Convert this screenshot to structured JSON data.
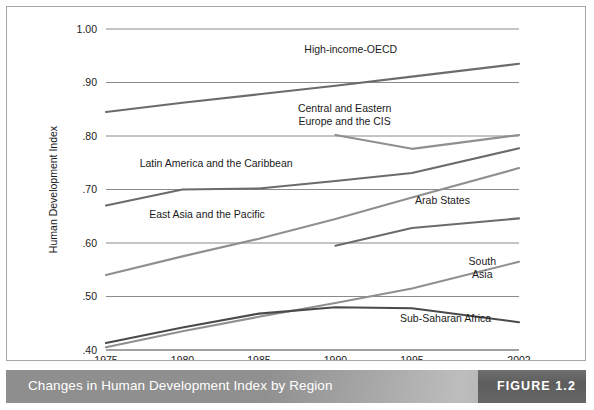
{
  "caption": {
    "title": "Changes in Human Development Index by Region",
    "figure_number": "FIGURE 1.2"
  },
  "chart_data": {
    "type": "line",
    "title": "Changes in Human Development Index by Region",
    "xlabel": "",
    "ylabel": "Human Development Index",
    "x": [
      1975,
      1980,
      1985,
      1990,
      1995,
      2002
    ],
    "xtick_labels": [
      "1975",
      "1980",
      "1985",
      "1990",
      "1995",
      "2002"
    ],
    "xlim": [
      1975,
      2002
    ],
    "ylim": [
      0.4,
      1.0
    ],
    "yticks": [
      0.4,
      0.5,
      0.6,
      0.7,
      0.8,
      0.9,
      1.0
    ],
    "ytick_labels": [
      ".40",
      ".50",
      ".60",
      ".70",
      ".80",
      ".90",
      "1.00"
    ],
    "grid": "horizontal",
    "legend_position": "inline-annotations",
    "series": [
      {
        "name": "High-income-OECD",
        "color": "#6b6b6b",
        "label_x": 1991.0,
        "label_y": 0.955,
        "label_anchor": "middle",
        "x": [
          1975,
          1980,
          1985,
          1990,
          1995,
          2002
        ],
        "values": [
          0.845,
          0.862,
          0.878,
          0.894,
          0.911,
          0.935
        ]
      },
      {
        "name": "Central and Eastern Europe and the CIS",
        "color": "#8f8f8f",
        "label_lines": [
          "Central and Eastern",
          "Europe and the CIS"
        ],
        "label_x": 1990.6,
        "label_y": 0.845,
        "label_anchor": "middle",
        "x": [
          1990,
          1995,
          2002
        ],
        "values": [
          0.802,
          0.776,
          0.802
        ]
      },
      {
        "name": "Latin America and the Caribbean",
        "color": "#6b6b6b",
        "label_x": 1982.2,
        "label_y": 0.742,
        "label_anchor": "middle",
        "x": [
          1975,
          1980,
          1985,
          1990,
          1995,
          2002
        ],
        "values": [
          0.67,
          0.7,
          0.702,
          0.716,
          0.731,
          0.777
        ]
      },
      {
        "name": "East Asia and the Pacific",
        "color": "#8f8f8f",
        "label_x": 1981.6,
        "label_y": 0.646,
        "label_anchor": "middle",
        "x": [
          1975,
          1980,
          1985,
          1990,
          1995,
          2002
        ],
        "values": [
          0.54,
          0.575,
          0.608,
          0.645,
          0.685,
          0.74
        ]
      },
      {
        "name": "Arab States",
        "color": "#6b6b6b",
        "label_x": 1997.0,
        "label_y": 0.672,
        "label_anchor": "middle",
        "x": [
          1990,
          1995,
          2002
        ],
        "values": [
          0.595,
          0.628,
          0.646
        ]
      },
      {
        "name": "South Asia",
        "color": "#8f8f8f",
        "label_lines": [
          "South",
          "Asia"
        ],
        "label_x": 1999.6,
        "label_y": 0.558,
        "label_anchor": "middle",
        "x": [
          1975,
          1980,
          1985,
          1990,
          1995,
          2002
        ],
        "values": [
          0.405,
          0.435,
          0.462,
          0.488,
          0.515,
          0.565
        ]
      },
      {
        "name": "Sub-Saharan Africa",
        "color": "#4a4a4a",
        "label_x": 1997.2,
        "label_y": 0.452,
        "label_anchor": "middle",
        "x": [
          1975,
          1980,
          1985,
          1990,
          1995,
          2002
        ],
        "values": [
          0.413,
          0.442,
          0.468,
          0.48,
          0.478,
          0.452
        ]
      }
    ]
  }
}
